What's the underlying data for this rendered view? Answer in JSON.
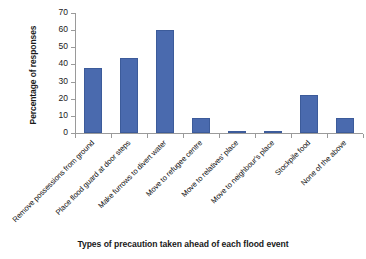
{
  "chart_data": {
    "type": "bar",
    "title": "",
    "xlabel": "Types of precaution taken ahead of each flood event",
    "ylabel": "Percentage of responses",
    "ylim": [
      0,
      70
    ],
    "ytick_step": 10,
    "yticks": [
      0,
      10,
      20,
      30,
      40,
      50,
      60,
      70
    ],
    "ytick_labels": [
      "0",
      "10",
      "20",
      "30",
      "40",
      "50",
      "60",
      "70"
    ],
    "grid": false,
    "legend": "none",
    "bar_color": "#4a6aae",
    "categories": [
      "Remove possessions from ground",
      "Place flood guard at door steps",
      "Make furrows to divert water",
      "Move to refugee centre",
      "Move to relatives' place",
      "Move to neighbour's place",
      "Stockpile food",
      "None of the above"
    ],
    "values": [
      38,
      44,
      60,
      9,
      1,
      0.3,
      22,
      9
    ]
  }
}
